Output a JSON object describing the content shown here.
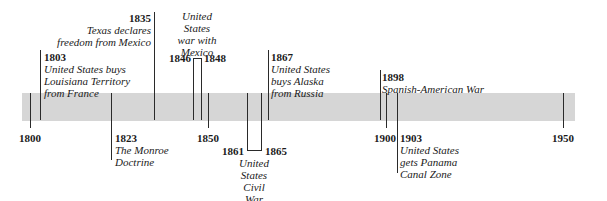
{
  "timeline": {
    "range": {
      "start": 1800,
      "end": 1950
    },
    "axis_labels": [
      "1800",
      "1850",
      "1900",
      "1950"
    ],
    "bar_color": "#d6d6d6",
    "events": [
      {
        "year": "1803",
        "text": "United States buys\nLouisiana Territory\nfrom France"
      },
      {
        "year": "1823",
        "text": "The Monroe\nDoctrine"
      },
      {
        "year": "1835",
        "text": "Texas declares\nfreedom from Mexico"
      },
      {
        "year_start": "1846",
        "year_end": "1848",
        "text": "United\nStates\nwar with\nMexico"
      },
      {
        "year_start": "1861",
        "year_end": "1865",
        "text": "United\nStates\nCivil\nWar"
      },
      {
        "year": "1867",
        "text": "United States\nbuys Alaska\nfrom Russia"
      },
      {
        "year": "1898",
        "text": "Spanish-American War"
      },
      {
        "year": "1903",
        "text": "United States\ngets Panama\nCanal Zone"
      }
    ]
  }
}
